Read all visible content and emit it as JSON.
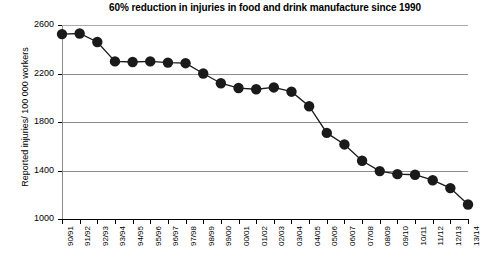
{
  "chart_data": {
    "type": "line",
    "title": "60% reduction in injuries in food and drink manufacture since 1990",
    "xlabel": "",
    "ylabel": "Reported injuries/ 100 000 workers",
    "ylim": [
      1000,
      2600
    ],
    "ytick_values": [
      1000,
      1400,
      1800,
      2200,
      2600
    ],
    "ytick_labels": [
      "1000",
      "1400",
      "1800",
      "2200",
      "2600"
    ],
    "grid": true,
    "legend": false,
    "marker": "filled-circle",
    "marker_color": "#1a1a1a",
    "line_color": "#1a1a1a",
    "categories": [
      "90/91",
      "91/92",
      "92/93",
      "93/94",
      "94/95",
      "95/96",
      "96/97",
      "97/98",
      "98/99",
      "99/00",
      "00/01",
      "01/02",
      "02/03",
      "03/04",
      "04/05",
      "05/06",
      "06/07",
      "07/08",
      "08/09",
      "09/10",
      "10/11",
      "11/12",
      "12/13",
      "13/14"
    ],
    "values": [
      2525,
      2530,
      2460,
      2300,
      2295,
      2300,
      2290,
      2285,
      2200,
      2120,
      2080,
      2070,
      2085,
      2050,
      1930,
      1710,
      1615,
      1480,
      1395,
      1370,
      1365,
      1320,
      1255,
      1120
    ]
  },
  "colors": {
    "background": "#ffffff",
    "gridline": "#8c8c8c",
    "axis": "#000000",
    "text": "#000000"
  }
}
